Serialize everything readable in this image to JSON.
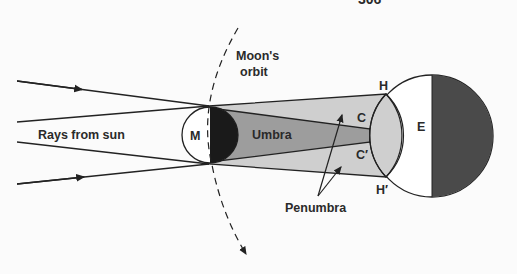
{
  "diagram": {
    "header_fragment": "306",
    "labels": {
      "rays": "Rays from sun",
      "moon": "M",
      "orbit_line1": "Moon's",
      "orbit_line2": "orbit",
      "umbra": "Umbra",
      "penumbra": "Penumbra",
      "earth": "E",
      "h_top": "H",
      "h_bottom": "H′",
      "c_top": "C",
      "c_bottom": "C′"
    },
    "colors": {
      "background": "#fbfbfb",
      "line": "#222222",
      "penumbra_fill": "#cfcfcf",
      "umbra_fill": "#9d9d9d",
      "dark_fill": "#1a1a1a",
      "earth_night": "#4a4a4a",
      "light_fill": "#ffffff"
    }
  }
}
